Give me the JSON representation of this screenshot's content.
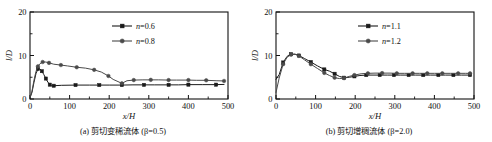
{
  "figure": {
    "background": "#ffffff",
    "axis_color": "#111111",
    "series_color_1": "#1a1a1a",
    "series_color_2": "#4a4a4a"
  },
  "panels": [
    {
      "id": "panel-a",
      "caption": "(a) 剪切变稀流体 (β=0.5)",
      "caption_label": "(a)",
      "caption_title": "剪切变稀流体",
      "caption_param": "(β=0.5)",
      "legend": [
        {
          "label": "n=0.6",
          "marker": "square"
        },
        {
          "label": "n=0.8",
          "marker": "circle"
        }
      ],
      "chart_data": {
        "type": "line",
        "title": "(a) 剪切变稀流体 (β=0.5)",
        "xlabel": "x/H",
        "ylabel": "l/D",
        "xlim": [
          0,
          500
        ],
        "ylim": [
          0,
          20
        ],
        "xticks": [
          0,
          100,
          200,
          300,
          400,
          500
        ],
        "yticks": [
          0,
          10,
          20
        ],
        "minor_xticks": [
          50,
          150,
          250,
          350,
          450
        ],
        "minor_yticks": [
          5,
          15
        ],
        "grid": false,
        "legend_position": "top-center",
        "series": [
          {
            "name": "n=0.6",
            "marker": "square",
            "x": [
              0,
              5,
              10,
              15,
              20,
              25,
              30,
              35,
              40,
              45,
              50,
              55,
              60,
              80,
              115,
              150,
              175,
              200,
              232,
              260,
              288,
              315,
              350,
              375,
              400,
              435,
              470,
              490
            ],
            "y": [
              0.3,
              1.5,
              3.8,
              5.8,
              6.9,
              6.9,
              6.4,
              5.6,
              4.7,
              3.9,
              3.3,
              3.0,
              3.05,
              3.15,
              3.2,
              3.2,
              3.2,
              3.2,
              3.2,
              3.25,
              3.25,
              3.25,
              3.25,
              3.25,
              3.3,
              3.3,
              3.3,
              3.35
            ]
          },
          {
            "name": "n=0.8",
            "marker": "circle",
            "x": [
              0,
              5,
              10,
              15,
              20,
              25,
              32,
              40,
              48,
              60,
              78,
              95,
              118,
              140,
              162,
              180,
              198,
              210,
              232,
              245,
              262,
              285,
              305,
              325,
              350,
              370,
              400,
              420,
              445,
              470,
              490
            ],
            "y": [
              0.3,
              1.8,
              4.3,
              6.3,
              7.5,
              8.1,
              8.5,
              8.5,
              8.3,
              8.0,
              7.8,
              7.6,
              7.3,
              7.1,
              6.7,
              6.2,
              5.3,
              4.5,
              3.6,
              4.2,
              4.35,
              4.4,
              4.4,
              4.4,
              4.35,
              4.35,
              4.35,
              4.3,
              4.3,
              4.2,
              4.15
            ]
          }
        ]
      }
    },
    {
      "id": "panel-b",
      "caption": "(b) 剪切增稠流体 (β=2.0)",
      "caption_label": "(b)",
      "caption_title": "剪切增稠流体",
      "caption_param": "(β=2.0)",
      "legend": [
        {
          "label": "n=1.1",
          "marker": "square"
        },
        {
          "label": "n=1.2",
          "marker": "circle"
        }
      ],
      "chart_data": {
        "type": "line",
        "title": "(b) 剪切增稠流体 (β=2.0)",
        "xlabel": "x/H",
        "ylabel": "l/D",
        "xlim": [
          0,
          500
        ],
        "ylim": [
          0,
          20
        ],
        "xticks": [
          0,
          100,
          200,
          300,
          400,
          500
        ],
        "yticks": [
          0,
          10,
          20
        ],
        "minor_xticks": [
          50,
          150,
          250,
          350,
          450
        ],
        "minor_yticks": [
          5,
          15
        ],
        "grid": false,
        "legend_position": "top-center",
        "series": [
          {
            "name": "n=1.1",
            "marker": "square",
            "x": [
              0,
              8,
              18,
              28,
              38,
              48,
              58,
              72,
              88,
              105,
              122,
              135,
              148,
              160,
              172,
              185,
              198,
              212,
              228,
              245,
              262,
              282,
              298,
              315,
              335,
              352,
              372,
              390,
              410,
              428,
              448,
              468,
              490
            ],
            "y": [
              4.5,
              5.6,
              8.4,
              9.8,
              10.3,
              10.3,
              10.0,
              9.3,
              8.5,
              7.6,
              6.8,
              6.4,
              5.8,
              5.2,
              4.9,
              5.0,
              5.2,
              5.4,
              5.5,
              5.5,
              5.5,
              5.5,
              5.5,
              5.5,
              5.5,
              5.5,
              5.5,
              5.5,
              5.5,
              5.5,
              5.5,
              5.5,
              5.5
            ]
          },
          {
            "name": "n=1.2",
            "marker": "circle",
            "x": [
              0,
              8,
              18,
              28,
              38,
              48,
              58,
              72,
              88,
              105,
              122,
              135,
              148,
              160,
              172,
              185,
              198,
              215,
              232,
              250,
              268,
              288,
              305,
              325,
              345,
              362,
              382,
              400,
              420,
              440,
              460,
              478,
              490
            ],
            "y": [
              1.5,
              4.8,
              8.0,
              9.6,
              10.2,
              10.3,
              9.9,
              9.0,
              8.0,
              7.0,
              6.0,
              5.4,
              4.9,
              4.7,
              4.8,
              5.2,
              5.5,
              5.8,
              5.9,
              5.95,
              5.95,
              5.95,
              5.9,
              5.9,
              5.9,
              5.9,
              5.9,
              5.9,
              5.9,
              5.9,
              5.9,
              5.9,
              5.9
            ]
          }
        ]
      }
    }
  ]
}
